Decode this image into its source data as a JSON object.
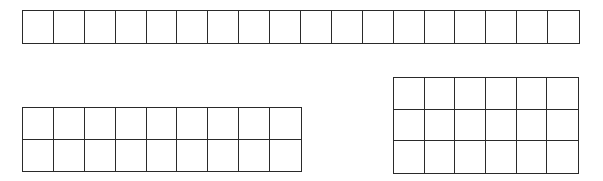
{
  "diagram": {
    "line_color": "#2a2a2a",
    "background": "#ffffff",
    "grids": [
      {
        "id": "grid-1x18",
        "rows": 1,
        "cols": 18,
        "total": 18,
        "left": 22,
        "top": 10,
        "width": 558,
        "height": 34
      },
      {
        "id": "grid-2x9",
        "rows": 2,
        "cols": 9,
        "total": 18,
        "left": 22,
        "top": 107,
        "width": 280,
        "height": 65
      },
      {
        "id": "grid-3x6",
        "rows": 3,
        "cols": 6,
        "total": 18,
        "left": 393,
        "top": 77,
        "width": 186,
        "height": 97
      }
    ]
  }
}
